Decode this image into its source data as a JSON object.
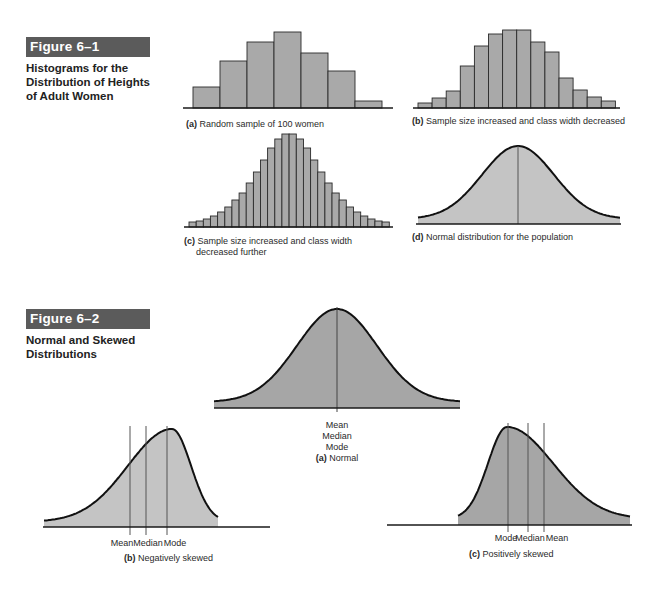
{
  "figure1": {
    "label": "Figure 6–1",
    "title_lines": [
      "Histograms for the",
      "Distribution of Heights",
      "of Adult Women"
    ]
  },
  "figure2": {
    "label": "Figure 6–2",
    "title_lines": [
      "Normal and Skewed",
      "Distributions"
    ]
  },
  "colors": {
    "banner": "#5b5b5b",
    "histogram_fill": "#a9a9a9",
    "curve_fill_light": "#c4c4c4",
    "curve_fill_dark": "#a6a6a6",
    "outline": "#1a1a1a"
  },
  "chart_data": [
    {
      "type": "bar",
      "id": "1a",
      "title": "(a) Random sample of 100 women",
      "caption_letter": "(a)",
      "caption_text": "Random sample of 100 women",
      "xlabel": "",
      "ylabel": "",
      "categories": [
        "1",
        "2",
        "3",
        "4",
        "5",
        "6",
        "7"
      ],
      "values": [
        21,
        47,
        66,
        76,
        55,
        37,
        7
      ]
    },
    {
      "type": "bar",
      "id": "1b",
      "title": "(b) Sample size increased and class width decreased",
      "caption_letter": "(b)",
      "caption_text": "Sample size increased and class width decreased",
      "xlabel": "",
      "ylabel": "",
      "categories": [
        "1",
        "2",
        "3",
        "4",
        "5",
        "6",
        "7",
        "8",
        "9",
        "10",
        "11",
        "12",
        "13",
        "14"
      ],
      "values": [
        5,
        10,
        17,
        42,
        62,
        74,
        78,
        78,
        66,
        56,
        30,
        18,
        11,
        7
      ]
    },
    {
      "type": "bar",
      "id": "1c",
      "title": "(c) Sample size increased and class width decreased further",
      "caption_letter": "(c)",
      "caption_lines": [
        "Sample size increased and class width",
        "decreased further"
      ],
      "xlabel": "",
      "ylabel": "",
      "categories": [
        "1",
        "2",
        "3",
        "4",
        "5",
        "6",
        "7",
        "8",
        "9",
        "10",
        "11",
        "12",
        "13",
        "14",
        "15",
        "16",
        "17",
        "18",
        "19",
        "20",
        "21",
        "22",
        "23",
        "24",
        "25",
        "26",
        "27",
        "28"
      ],
      "values": [
        5,
        6,
        8,
        11,
        15,
        20,
        27,
        34,
        44,
        55,
        67,
        79,
        88,
        93,
        93,
        88,
        79,
        67,
        55,
        44,
        34,
        27,
        20,
        15,
        11,
        8,
        6,
        5
      ]
    },
    {
      "type": "area",
      "id": "1d",
      "title": "(d) Normal distribution for the population",
      "caption_letter": "(d)",
      "caption_text": "Normal distribution for the population",
      "shape": "normal",
      "center_line": true
    },
    {
      "type": "area",
      "id": "2a",
      "title": "(a) Normal",
      "caption_letter": "(a)",
      "caption_text": "Normal",
      "shape": "normal",
      "annotations": [
        "Mean",
        "Median",
        "Mode"
      ]
    },
    {
      "type": "area",
      "id": "2b",
      "title": "(b) Negatively skewed",
      "caption_letter": "(b)",
      "caption_text": "Negatively skewed",
      "shape": "negatively skewed",
      "annotations": [
        "Mean",
        "Median",
        "Mode"
      ]
    },
    {
      "type": "area",
      "id": "2c",
      "title": "(c) Positively skewed",
      "caption_letter": "(c)",
      "caption_text": "Positively skewed",
      "shape": "positively skewed",
      "annotations": [
        "Mode",
        "Median",
        "Mean"
      ]
    }
  ]
}
